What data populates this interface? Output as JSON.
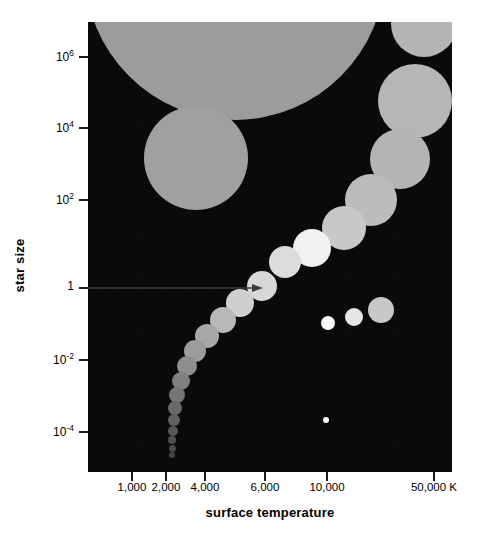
{
  "chart_data": {
    "type": "scatter",
    "title": "",
    "xlabel": "surface temperature",
    "ylabel": "star size",
    "xscale": "log",
    "yscale": "log",
    "xtick_labels": [
      "1,000",
      "2,000",
      "4,000",
      "6,000",
      "10,000",
      "50,000 K"
    ],
    "xtick_values": [
      1000,
      2000,
      4000,
      6000,
      10000,
      50000
    ],
    "ytick_labels": [
      "10⁶",
      "10⁴",
      "10²",
      "1",
      "10⁻²",
      "10⁻⁴"
    ],
    "ytick_values": [
      1000000,
      10000,
      100,
      1,
      0.01,
      0.0001
    ],
    "xlim": [
      700,
      60000
    ],
    "ylim": [
      2e-05,
      5000000
    ],
    "grid": false,
    "legend": false,
    "background": "#0a0a0a",
    "annotations": [
      {
        "name": "sun-arrow",
        "text": "",
        "points_to": "sun",
        "x": 6000,
        "y": 1
      }
    ],
    "series": [
      {
        "name": "supergiants",
        "color": "#9a9a9a",
        "points": [
          {
            "label": "supergiant-red",
            "x_px": 235,
            "y_px": -30,
            "r_px": 150,
            "color": "#9c9c9c"
          },
          {
            "label": "giant-red",
            "x_px": 196,
            "y_px": 158,
            "r_px": 52,
            "color": "#a0a0a0"
          }
        ]
      },
      {
        "name": "blue-supergiants",
        "color": "#b8b8b8",
        "points": [
          {
            "label": "blue-supergiant-1",
            "x_px": 424,
            "y_px": 24,
            "r_px": 33,
            "color": "#b4b4b4"
          },
          {
            "label": "blue-supergiant-2",
            "x_px": 415,
            "y_px": 101,
            "r_px": 37,
            "color": "#b6b6b6"
          },
          {
            "label": "blue-supergiant-3",
            "x_px": 400,
            "y_px": 159,
            "r_px": 30,
            "color": "#b4b4b4"
          },
          {
            "label": "blue-giant-4",
            "x_px": 371,
            "y_px": 200,
            "r_px": 26,
            "color": "#bcbcbc"
          }
        ]
      },
      {
        "name": "main-sequence",
        "color": "#d6d6d6",
        "points": [
          {
            "label": "ms-O",
            "x_px": 344,
            "y_px": 228,
            "r_px": 22,
            "color": "#c8c8c8"
          },
          {
            "label": "ms-B",
            "x_px": 312,
            "y_px": 248,
            "r_px": 19,
            "color": "#f2f2f2"
          },
          {
            "label": "ms-A",
            "x_px": 285,
            "y_px": 262,
            "r_px": 16,
            "color": "#dcdcdc"
          },
          {
            "label": "sun",
            "x_px": 262,
            "y_px": 286,
            "r_px": 15,
            "color": "#d8d8d8"
          },
          {
            "label": "ms-G",
            "x_px": 240,
            "y_px": 303,
            "r_px": 14,
            "color": "#cfcfcf"
          },
          {
            "label": "ms-K1",
            "x_px": 223,
            "y_px": 320,
            "r_px": 13,
            "color": "#b8b8b8"
          },
          {
            "label": "ms-K2",
            "x_px": 207,
            "y_px": 336,
            "r_px": 12,
            "color": "#a8a8a8"
          },
          {
            "label": "ms-K3",
            "x_px": 195,
            "y_px": 351,
            "r_px": 11,
            "color": "#9c9c9c"
          },
          {
            "label": "ms-M1",
            "x_px": 187,
            "y_px": 366,
            "r_px": 10,
            "color": "#8e8e8e"
          },
          {
            "label": "ms-M2",
            "x_px": 181,
            "y_px": 381,
            "r_px": 9,
            "color": "#808080"
          },
          {
            "label": "ms-M3",
            "x_px": 177,
            "y_px": 395,
            "r_px": 8,
            "color": "#757575"
          },
          {
            "label": "ms-M4",
            "x_px": 175,
            "y_px": 408,
            "r_px": 7,
            "color": "#6a6a6a"
          },
          {
            "label": "ms-M5",
            "x_px": 174,
            "y_px": 420,
            "r_px": 6,
            "color": "#606060"
          },
          {
            "label": "ms-M6",
            "x_px": 173,
            "y_px": 431,
            "r_px": 5,
            "color": "#585858"
          },
          {
            "label": "ms-M7",
            "x_px": 172,
            "y_px": 440,
            "r_px": 4,
            "color": "#505050"
          },
          {
            "label": "ms-M8",
            "x_px": 172,
            "y_px": 448,
            "r_px": 3.5,
            "color": "#4a4a4a"
          },
          {
            "label": "ms-M9",
            "x_px": 172,
            "y_px": 455,
            "r_px": 3,
            "color": "#454545"
          }
        ]
      },
      {
        "name": "white-dwarfs",
        "color": "#f0f0f0",
        "points": [
          {
            "label": "white-dwarf-1",
            "x_px": 328,
            "y_px": 323,
            "r_px": 7,
            "color": "#fbfbfb"
          },
          {
            "label": "white-dwarf-2",
            "x_px": 354,
            "y_px": 317,
            "r_px": 9,
            "color": "#e6e6e6"
          },
          {
            "label": "white-dwarf-3",
            "x_px": 381,
            "y_px": 310,
            "r_px": 13,
            "color": "#c8c8c8"
          },
          {
            "label": "neutron-star",
            "x_px": 326,
            "y_px": 420,
            "r_px": 3,
            "color": "#ffffff"
          }
        ]
      }
    ]
  },
  "axes": {
    "y_title": "star size",
    "x_title": "surface temperature",
    "y_ticks": [
      {
        "label_base": "10",
        "label_exp": "6",
        "y_px": 57
      },
      {
        "label_base": "10",
        "label_exp": "4",
        "y_px": 128
      },
      {
        "label_base": "10",
        "label_exp": "2",
        "y_px": 200
      },
      {
        "label_base": "1",
        "label_exp": "",
        "y_px": 288
      },
      {
        "label_base": "10",
        "label_exp": "-2",
        "y_px": 360
      },
      {
        "label_base": "10",
        "label_exp": "-4",
        "y_px": 432
      }
    ],
    "x_ticks": [
      {
        "label": "1,000",
        "x_px": 132
      },
      {
        "label": "2,000",
        "x_px": 166
      },
      {
        "label": "4,000",
        "x_px": 205
      },
      {
        "label": "6,000",
        "x_px": 265
      },
      {
        "label": "10,000",
        "x_px": 327
      },
      {
        "label": "50,000 K",
        "x_px": 434
      }
    ]
  },
  "colors": {
    "plot_background": "#0a0a0a",
    "axis": "#1a1a1a",
    "text": "#000000",
    "arrow": "#3a3a3a"
  }
}
